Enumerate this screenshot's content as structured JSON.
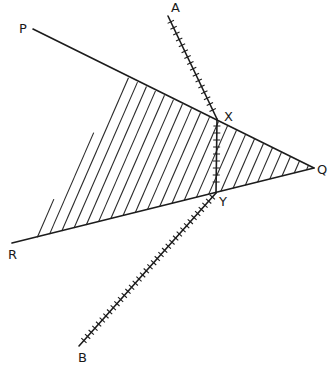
{
  "diagram": {
    "title": "",
    "colors": {
      "ink": "#1c1c1c",
      "background": "#ffffff"
    },
    "points": {
      "P": {
        "label": "P",
        "x": 33,
        "y": 29,
        "label_x": 19,
        "label_y": 33
      },
      "Q": {
        "label": "Q",
        "x": 314,
        "y": 168,
        "label_x": 317,
        "label_y": 174
      },
      "R": {
        "label": "R",
        "x": 12,
        "y": 243,
        "label_x": 8,
        "label_y": 259
      },
      "A": {
        "label": "A",
        "x": 168,
        "y": 16,
        "label_x": 171,
        "label_y": 12
      },
      "B": {
        "label": "B",
        "x": 79,
        "y": 346,
        "label_x": 78,
        "label_y": 362
      },
      "X": {
        "label": "X",
        "x": 217,
        "y": 119,
        "label_x": 224,
        "label_y": 121
      },
      "Y": {
        "label": "Y",
        "x": 216,
        "y": 193,
        "label_x": 219,
        "label_y": 206
      }
    },
    "lines": [
      {
        "name": "line-pq",
        "from": "P",
        "to": "Q"
      },
      {
        "name": "line-rq",
        "from": "R",
        "to": "Q"
      },
      {
        "name": "line-ax",
        "from": "A",
        "to": "X",
        "ticked": true,
        "tick_spacing": 6.5
      },
      {
        "name": "segment-xy",
        "from": "X",
        "to": "Y",
        "ticked": true,
        "tick_spacing": 7
      },
      {
        "name": "line-yb",
        "from": "Y",
        "to": "B",
        "ticked": true,
        "tick_spacing": 5.5
      }
    ],
    "shaded_region": {
      "description": "hatched triangle",
      "vertices": [
        [
          127,
          77
        ],
        [
          314,
          168
        ],
        [
          30,
          239
        ]
      ],
      "hatch_spacing": 10,
      "hatch_direction": [
        0.4,
        -0.92
      ]
    }
  }
}
